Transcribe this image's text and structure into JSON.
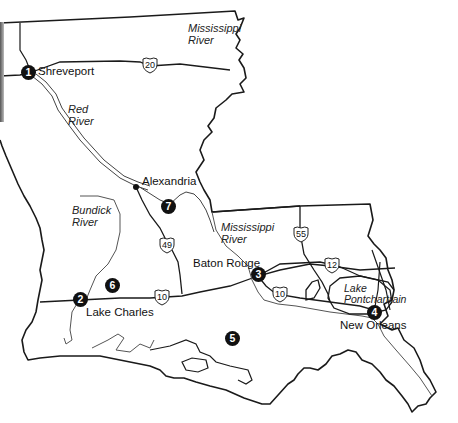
{
  "map": {
    "region": "Louisiana",
    "cities": [
      {
        "name": "Shreveport"
      },
      {
        "name": "Alexandria"
      },
      {
        "name": "Baton Rouge"
      },
      {
        "name": "Lake Charles"
      },
      {
        "name": "New Orleans"
      }
    ],
    "markers": [
      {
        "number": "1",
        "near": "Shreveport"
      },
      {
        "number": "2",
        "near": "Lake Charles"
      },
      {
        "number": "3",
        "near": "Baton Rouge"
      },
      {
        "number": "4",
        "near": "New Orleans"
      },
      {
        "number": "5",
        "near": "Gulf coast"
      },
      {
        "number": "6",
        "near": "Southwest Louisiana"
      },
      {
        "number": "7",
        "near": "Alexandria"
      }
    ],
    "rivers": [
      {
        "name": "Mississippi\nRiver"
      },
      {
        "name": "Red\nRiver"
      },
      {
        "name": "Bundick\nRiver"
      },
      {
        "name": "Mississippi\nRiver"
      }
    ],
    "lakes": [
      {
        "name": "Lake\nPontchartrain"
      }
    ],
    "highways": [
      {
        "number": "20"
      },
      {
        "number": "49"
      },
      {
        "number": "55"
      },
      {
        "number": "12"
      },
      {
        "number": "10"
      },
      {
        "number": "10"
      }
    ],
    "colors": {
      "outline": "#1a1a1a",
      "river": "#555555",
      "marker": "#111111",
      "background": "#ffffff"
    }
  }
}
